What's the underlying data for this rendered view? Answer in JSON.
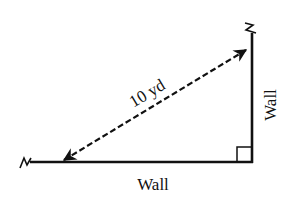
{
  "diagram": {
    "type": "right-triangle-corner",
    "labels": {
      "hypotenuse": "10 yd",
      "bottom_wall": "Wall",
      "right_wall": "Wall"
    },
    "colors": {
      "line": "#111111",
      "background": "#ffffff"
    },
    "elements": {
      "bottom_wall": {
        "x1": 30,
        "y1": 162,
        "x2": 253,
        "y2": 162
      },
      "right_wall": {
        "x1": 252,
        "y1": 33,
        "x2": 252,
        "y2": 163
      },
      "hypotenuse_arrow": {
        "x1": 62,
        "y1": 161,
        "x2": 248,
        "y2": 49,
        "style": "dashed",
        "arrowheads": "both"
      },
      "right_angle_marker": {
        "x": 237,
        "y": 147,
        "size": 15
      }
    }
  }
}
